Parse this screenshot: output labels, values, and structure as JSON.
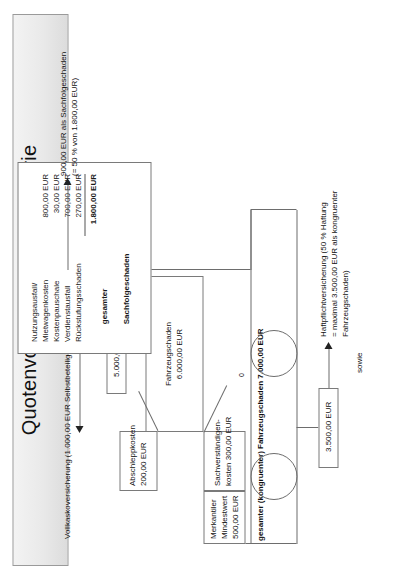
{
  "title": {
    "heading": "Quotenvorrecht/Differenztheorie",
    "subtitle": "Beispiel 1: Haftungsquote 50 %"
  },
  "axis": {
    "zero_label": "0"
  },
  "connector": {
    "sowie": "sowie"
  },
  "vehicle_damage": {
    "insurance_note": "Vollkaskoversicherung (1.000,00 EUR Selbstbeteiligung)",
    "payout_box": "5.000,00 EUR",
    "main_box": {
      "label": "Fahrzeugschaden",
      "value": "6.000,00 EUR"
    },
    "towing_box": {
      "label": "Abschleppkosten",
      "value": "200,00 EUR"
    },
    "expert_box": {
      "label": "Sachverständigen-",
      "label2": "kosten 300,00 EUR"
    },
    "merkantil_box": {
      "label": "Merkantiler",
      "label2": "Mindestwert",
      "value": "500,00 EUR"
    },
    "total_label": "gesamter (kongruenter) Fahrzeugschaden 7.000,00 EUR",
    "liability_payout_box": "3.500,00 EUR",
    "liability_note_l1": "Haftpflichtversicherung (50 % Haftung",
    "liability_note_l2": "= maximal 3.500,00 EUR als kongruenter",
    "liability_note_l3": "Fahrzeugschaden)"
  },
  "consequential_damage": {
    "rows": [
      {
        "label": "Nutzungsausfall/",
        "value": ""
      },
      {
        "label": "Mietwagenkosten",
        "value": "800,00 EUR"
      },
      {
        "label": "Kostenpauschale",
        "value": "30,00 EUR"
      },
      {
        "label": "Verdienstausfall",
        "value": "700,00 EUR"
      },
      {
        "label": "Rückstufungsschaden",
        "value": "270,00 EUR"
      }
    ],
    "total_label_l1": "gesamter",
    "total_label_l2": "Sachfolgeschaden",
    "total_value": "1.800,00 EUR",
    "result_note_l1": "900,00 EUR als Sachfolgeschaden",
    "result_note_l2": "(= 50 % von 1.800,00 EUR)"
  }
}
